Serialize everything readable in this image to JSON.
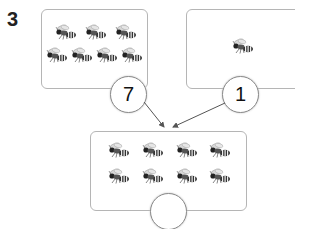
{
  "question": {
    "number": "3"
  },
  "groups": [
    {
      "id": "left",
      "bee_count": 7,
      "count_label": "7"
    },
    {
      "id": "right",
      "bee_count": 1,
      "count_label": "1"
    },
    {
      "id": "total",
      "bee_count": 8,
      "count_label": ""
    }
  ],
  "icons": {
    "bee": "bee-icon"
  },
  "colors": {
    "border": "#b5b5b5",
    "circle_border": "#8a8a8a",
    "arrow": "#555555"
  }
}
